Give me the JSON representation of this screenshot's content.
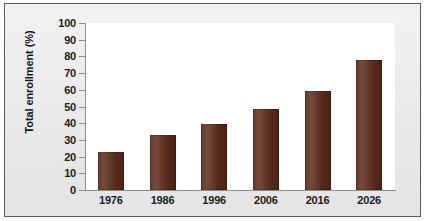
{
  "chart_data": {
    "type": "bar",
    "title": "",
    "xlabel": "",
    "ylabel": "Total enrollment (%)",
    "categories": [
      "1976",
      "1986",
      "1996",
      "2006",
      "2016",
      "2026"
    ],
    "values": [
      23,
      33,
      39.5,
      48.5,
      59.5,
      78
    ],
    "ylim": [
      0,
      100
    ],
    "ytick_labels": [
      "100",
      "90",
      "80",
      "70",
      "60",
      "50",
      "40",
      "30",
      "20",
      "10",
      "0"
    ],
    "ytick_values": [
      100,
      90,
      80,
      70,
      60,
      50,
      40,
      30,
      20,
      10,
      0
    ],
    "grid": false,
    "legend": null,
    "series": [
      {
        "name": "Total enrollment",
        "values": [
          23,
          33,
          39.5,
          48.5,
          59.5,
          78
        ]
      }
    ],
    "colors": {
      "bar": "#5e2d1c",
      "plot_background": "#ffffff",
      "figure_background": "#ececec",
      "frame_border": "#5a5a5a",
      "axis_line": "#8d8d8d",
      "text": "#1c1c1c"
    }
  }
}
